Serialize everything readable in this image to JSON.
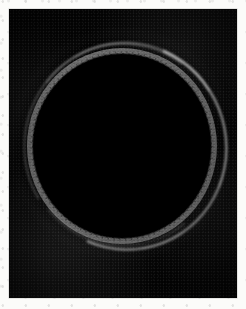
{
  "figure": {
    "caption": "",
    "domain_label": "grayscale-sphere-image",
    "width_px": 246,
    "height_px": 309,
    "background_color": "#fbfbf9"
  },
  "plate": {
    "label": "image-plate",
    "left_px": 9,
    "top_px": 9,
    "width_px": 228,
    "height_px": 289,
    "field_color": "#030303"
  },
  "disk": {
    "label": "illuminated-sphere",
    "center_x_px": 122,
    "center_y_px": 146,
    "radius_x_px": 95,
    "radius_y_px": 98,
    "interior_color": "#666666",
    "limb_color": "#b4b4b4",
    "halo_color": "#d8d8d8"
  },
  "overlay": {
    "label": "dotted-limb-ring",
    "style": "dashed",
    "dot_color": "#0a0a0a",
    "dash_length_px": 2,
    "gap_length_px": 4,
    "ring_radius_x_px": 89,
    "ring_radius_y_px": 92
  },
  "highlights": [
    {
      "name": "bright-arc-lower-right",
      "color": "#ffffff",
      "intensity": "high"
    },
    {
      "name": "bright-arc-upper-left",
      "color": "#ffffff",
      "intensity": "medium"
    },
    {
      "name": "bright-arc-top",
      "color": "#ffffff",
      "intensity": "medium"
    },
    {
      "name": "bright-arc-bottom",
      "color": "#ffffff",
      "intensity": "low"
    }
  ]
}
